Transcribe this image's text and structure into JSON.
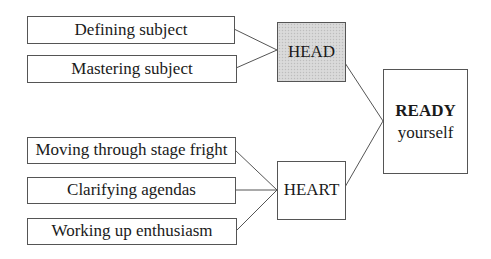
{
  "diagram": {
    "type": "tree-flow",
    "direction": "left-to-right",
    "head_group": {
      "hub": {
        "label": "HEAD",
        "fill": "#d6d6d6",
        "pattern": "stippled"
      },
      "items": [
        {
          "label": "Defining subject"
        },
        {
          "label": "Mastering subject"
        }
      ]
    },
    "heart_group": {
      "hub": {
        "label": "HEART",
        "fill": "#ffffff"
      },
      "items": [
        {
          "label": "Moving through stage fright"
        },
        {
          "label": "Clarifying agendas"
        },
        {
          "label": "Working up enthusiasm"
        }
      ]
    },
    "result": {
      "title": "READY",
      "subtitle": "yourself"
    },
    "edges": [
      {
        "from": "Defining subject",
        "to": "HEAD"
      },
      {
        "from": "Mastering subject",
        "to": "HEAD"
      },
      {
        "from": "Moving through stage fright",
        "to": "HEART"
      },
      {
        "from": "Clarifying agendas",
        "to": "HEART"
      },
      {
        "from": "Working up enthusiasm",
        "to": "HEART"
      },
      {
        "from": "HEAD",
        "to": "READY yourself"
      },
      {
        "from": "HEART",
        "to": "READY yourself"
      }
    ],
    "colors": {
      "border": "#555555",
      "line": "#555555",
      "text": "#1a1a1a",
      "background": "#ffffff"
    }
  }
}
